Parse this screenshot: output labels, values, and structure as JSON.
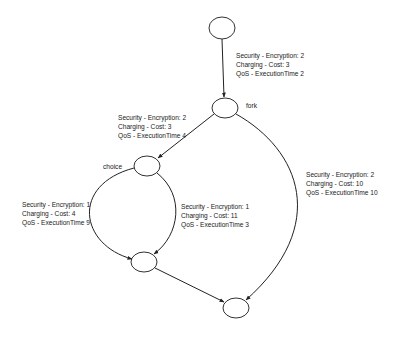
{
  "diagram": {
    "type": "workflow-graph",
    "nodes": [
      {
        "id": "start",
        "label": ""
      },
      {
        "id": "fork",
        "label": "fork"
      },
      {
        "id": "choice",
        "label": "choice"
      },
      {
        "id": "merge",
        "label": ""
      },
      {
        "id": "end",
        "label": ""
      }
    ],
    "edges": [
      {
        "from": "start",
        "to": "fork",
        "annotation": {
          "security": "Security - Encryption: 2",
          "charging": "Charging - Cost: 3",
          "qos": "QoS - ExecutionTime 2"
        }
      },
      {
        "from": "fork",
        "to": "choice",
        "annotation": {
          "security": "Security - Encryption: 2",
          "charging": "Charging - Cost: 3",
          "qos": "QoS - ExecutionTime 4"
        }
      },
      {
        "from": "choice",
        "to": "merge",
        "side": "left",
        "annotation": {
          "security": "Security - Encryption: 1",
          "charging": "Charging - Cost: 4",
          "qos": "QoS - ExecutionTime 9"
        }
      },
      {
        "from": "choice",
        "to": "merge",
        "side": "right",
        "annotation": {
          "security": "Security - Encryption: 1",
          "charging": "Charging - Cost: 11",
          "qos": "QoS - ExecutionTime 3"
        }
      },
      {
        "from": "fork",
        "to": "end",
        "annotation": {
          "security": "Security - Encryption: 2",
          "charging": "Charging - Cost: 10",
          "qos": "QoS - ExecutionTime 10"
        }
      },
      {
        "from": "merge",
        "to": "end",
        "annotation": null
      }
    ]
  }
}
